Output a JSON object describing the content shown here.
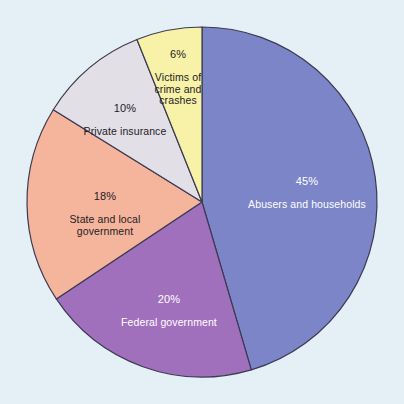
{
  "figure": {
    "background_color": "#e4f0f5",
    "outline_color": "#3c3a52"
  },
  "chart_data": {
    "type": "pie",
    "title": "",
    "subtitle": "",
    "xlabel": "",
    "ylabel": "",
    "grid": false,
    "legend_position": "none",
    "label_style": "inside-slice",
    "start_angle_deg": 0,
    "direction": "clockwise",
    "categories": [
      "Abusers and households",
      "Federal government",
      "State and local government",
      "Private insurance",
      "Victims of crime and crashes"
    ],
    "values": [
      45,
      20,
      18,
      10,
      6
    ],
    "value_unit": "%",
    "colors": [
      "#7b85c8",
      "#a170bd",
      "#f5b49c",
      "#e3dfe6",
      "#f7f2a8"
    ],
    "slices": [
      {
        "name": "Abusers and households",
        "percent_label": "45%",
        "value": 45,
        "color": "#7b85c8",
        "text_color": "#ffffff",
        "label_lines": [
          "45%",
          "Abusers and households"
        ]
      },
      {
        "name": "Federal government",
        "percent_label": "20%",
        "value": 20,
        "color": "#a170bd",
        "text_color": "#ffffff",
        "label_lines": [
          "20%",
          "Federal government"
        ]
      },
      {
        "name": "State and local government",
        "percent_label": "18%",
        "value": 18,
        "color": "#f5b49c",
        "text_color": "#1d1c26",
        "label_lines": [
          "18%",
          "State and local",
          "government"
        ]
      },
      {
        "name": "Private insurance",
        "percent_label": "10%",
        "value": 10,
        "color": "#e3dfe6",
        "text_color": "#1d1c26",
        "label_lines": [
          "10%",
          "Private insurance"
        ]
      },
      {
        "name": "Victims of crime and crashes",
        "percent_label": "6%",
        "value": 6,
        "color": "#f7f2a8",
        "text_color": "#1d1c26",
        "label_lines": [
          "6%",
          "Victims of",
          "crime and",
          "crashes"
        ]
      }
    ]
  }
}
